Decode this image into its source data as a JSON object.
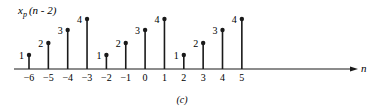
{
  "chart_data": {
    "type": "stem",
    "title_parts": {
      "base": "x",
      "sub": "p",
      "arg": "(n - 2)"
    },
    "xlabel": "n",
    "ylabel": "",
    "caption": "(c)",
    "x": [
      -6,
      -5,
      -4,
      -3,
      -2,
      -1,
      0,
      1,
      2,
      3,
      4,
      5
    ],
    "values": [
      1,
      2,
      3,
      4,
      1,
      2,
      3,
      4,
      1,
      2,
      3,
      4
    ],
    "tick_labels": [
      "-6",
      "-5",
      "-4",
      "-3",
      "-2",
      "-1",
      "0",
      "1",
      "2",
      "3",
      "4",
      "5"
    ],
    "value_labels": [
      "1",
      "2",
      "3",
      "4",
      "1",
      "2",
      "3",
      "4",
      "1",
      "2",
      "3",
      "4"
    ],
    "ylim": [
      0,
      4
    ],
    "grid": false,
    "legend": null
  }
}
